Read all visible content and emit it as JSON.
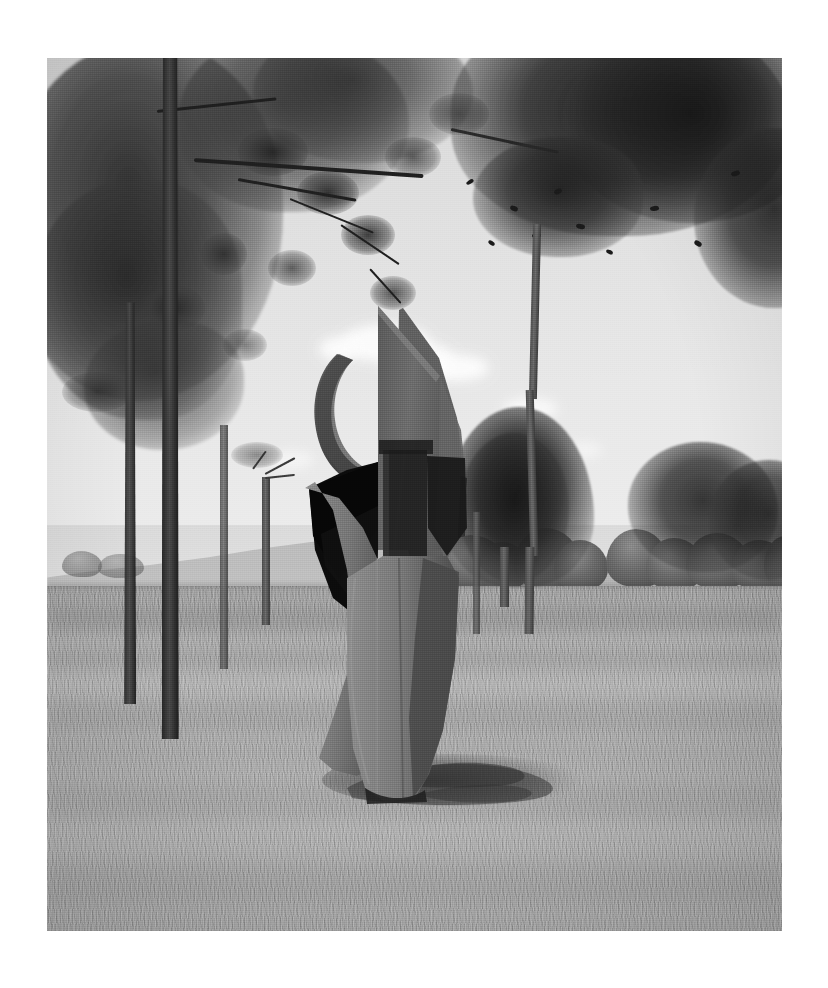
{
  "page": {
    "background_color": "#ffffff",
    "width": 828,
    "height": 988
  },
  "photograph": {
    "caption": "",
    "medium": "black-and-white photograph",
    "frame": {
      "left": 47,
      "top": 58,
      "width": 735,
      "height": 873
    },
    "palette": {
      "sky": "#e2e2e2",
      "cloud": "#fbfbfb",
      "hills": "#b9b9b9",
      "grass_light": "#b2b2b2",
      "grass_mid": "#a4a4a4",
      "foliage_dark": "#2b2b2b",
      "trunk_dark": "#242424",
      "sculpture_lit": "#8b8b8b",
      "sculpture_mid": "#6d6d6d",
      "sculpture_shadow": "#0c0c0c",
      "cast_shadow": "#4a4a4a"
    },
    "scene": {
      "subject": "abstract metal sculpture",
      "setting": "grass lawn in a park",
      "sky_description": "pale overcast sky with scattered white cumulus clouds",
      "background_description": "low distant hills behind a row of clipped shrubs",
      "foreground_description": "mown grass with a cast shadow extending to the right"
    },
    "sculpture": {
      "name": "abstract-sculpture",
      "form": "twisted sheet-metal column",
      "features": [
        "pointed triangular apex",
        "circular open ring at upper left",
        "rectangular inset panel at center",
        "deep shadowed interior cavity",
        "tapering narrow base set into the grass"
      ],
      "bounds": {
        "left_pct": 35,
        "top_pct": 32,
        "width_pct": 18,
        "height_pct": 57
      }
    },
    "trees": [
      {
        "name": "pine-tree-left-foreground",
        "type": "pine",
        "x_pct": 14,
        "note": "thick dark trunk, full needle canopy across upper left"
      },
      {
        "name": "pine-tree-left-second",
        "type": "pine",
        "x_pct": 24,
        "note": "slimmer pine trunk behind"
      },
      {
        "name": "slim-tree-right",
        "type": "deciduous",
        "x_pct": 66,
        "note": "tall slender trunk with leafy crown at upper right"
      },
      {
        "name": "conifer-background-right",
        "type": "conical conifer",
        "x_pct": 82,
        "note": "dense conical tree in the mid-ground"
      },
      {
        "name": "pollarded-tree-midground",
        "type": "pollarded",
        "x_pct": 30,
        "note": "small cut-back tree near the hills"
      }
    ],
    "shrubs": [
      {
        "name": "hedge-left",
        "x_pct": 57
      },
      {
        "name": "hedge-center",
        "x_pct": 65
      },
      {
        "name": "hedge-right",
        "x_pct": 88
      },
      {
        "name": "hedge-far-right",
        "x_pct": 97
      }
    ]
  }
}
